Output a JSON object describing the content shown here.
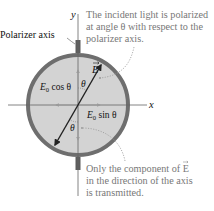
{
  "labels": {
    "y_axis": "y",
    "x_axis": "x",
    "polarizer_axis": "Polarizer axis",
    "e_vector": "E",
    "theta_top": "θ",
    "theta_bottom": "θ",
    "cos_component_main": "E",
    "cos_component_sub": "0",
    "cos_component_rest": " cos θ",
    "sin_component_main": "E",
    "sin_component_sub": "0",
    "sin_component_rest": " sin θ"
  },
  "callouts": {
    "top": {
      "line1": "The incident light is polarized",
      "line2": "at angle θ with respect to the",
      "line3": "polarizer axis."
    },
    "bottom": {
      "line1": "Only the component of E",
      "line2": "in the direction of the axis",
      "line3": "is transmitted."
    }
  },
  "colors": {
    "disk_fill": "#d3d3d3",
    "ring": "#6e6e6e",
    "axis_line": "#555555",
    "vector": "#222222",
    "component_arrow": "#9a9a9a",
    "callout_text": "#777777",
    "dashed_leader": "#999999"
  }
}
